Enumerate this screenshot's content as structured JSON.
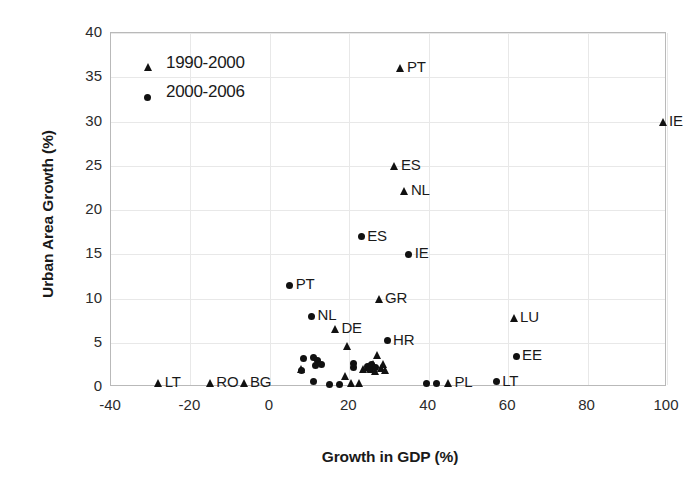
{
  "chart_data": {
    "type": "scatter",
    "title": "",
    "xlabel": "Growth in GDP (%)",
    "ylabel": "Urban Area Growth (%)",
    "xlim": [
      -40,
      100
    ],
    "ylim": [
      0,
      40
    ],
    "xticks": [
      -40,
      -20,
      0,
      20,
      40,
      60,
      80,
      100
    ],
    "yticks": [
      0,
      5,
      10,
      15,
      20,
      25,
      30,
      35,
      40
    ],
    "grid": true,
    "legend_position": "top-left",
    "series": [
      {
        "name": "1990-2000",
        "marker": "triangle",
        "color": "#111111",
        "points": [
          {
            "x": -28.0,
            "y": 0.4,
            "label": "LT"
          },
          {
            "x": -15.0,
            "y": 0.4,
            "label": "RO"
          },
          {
            "x": -6.5,
            "y": 0.5,
            "label": "BG"
          },
          {
            "x": 8.0,
            "y": 2.0,
            "label": ""
          },
          {
            "x": 16.5,
            "y": 6.5,
            "label": "DE"
          },
          {
            "x": 19.5,
            "y": 4.6,
            "label": ""
          },
          {
            "x": 19.0,
            "y": 1.2,
            "label": ""
          },
          {
            "x": 20.5,
            "y": 0.4,
            "label": ""
          },
          {
            "x": 22.5,
            "y": 0.4,
            "label": ""
          },
          {
            "x": 23.5,
            "y": 2.0,
            "label": ""
          },
          {
            "x": 24.5,
            "y": 2.3,
            "label": ""
          },
          {
            "x": 25.5,
            "y": 2.0,
            "label": ""
          },
          {
            "x": 26.0,
            "y": 2.6,
            "label": ""
          },
          {
            "x": 26.5,
            "y": 1.8,
            "label": ""
          },
          {
            "x": 27.5,
            "y": 10.0,
            "label": "GR"
          },
          {
            "x": 27.0,
            "y": 3.6,
            "label": ""
          },
          {
            "x": 28.0,
            "y": 2.2,
            "label": ""
          },
          {
            "x": 28.5,
            "y": 2.6,
            "label": ""
          },
          {
            "x": 29.0,
            "y": 1.9,
            "label": ""
          },
          {
            "x": 31.5,
            "y": 25.0,
            "label": "ES"
          },
          {
            "x": 34.0,
            "y": 22.2,
            "label": "NL"
          },
          {
            "x": 33.0,
            "y": 36.0,
            "label": "PT"
          },
          {
            "x": 45.0,
            "y": 0.5,
            "label": "PL"
          },
          {
            "x": 61.5,
            "y": 7.8,
            "label": "LU"
          },
          {
            "x": 99.0,
            "y": 30.0,
            "label": "IE"
          }
        ]
      },
      {
        "name": "2000-2006",
        "marker": "circle",
        "color": "#111111",
        "points": [
          {
            "x": 5.0,
            "y": 11.5,
            "label": "PT"
          },
          {
            "x": 10.5,
            "y": 8.0,
            "label": "NL"
          },
          {
            "x": 8.5,
            "y": 3.2,
            "label": ""
          },
          {
            "x": 8.0,
            "y": 1.9,
            "label": ""
          },
          {
            "x": 11.0,
            "y": 3.3,
            "label": ""
          },
          {
            "x": 12.0,
            "y": 3.0,
            "label": ""
          },
          {
            "x": 11.5,
            "y": 2.4,
            "label": ""
          },
          {
            "x": 11.0,
            "y": 0.6,
            "label": ""
          },
          {
            "x": 13.0,
            "y": 2.5,
            "label": ""
          },
          {
            "x": 15.0,
            "y": 0.3,
            "label": ""
          },
          {
            "x": 17.5,
            "y": 0.3,
            "label": ""
          },
          {
            "x": 21.0,
            "y": 2.7,
            "label": ""
          },
          {
            "x": 21.0,
            "y": 2.2,
            "label": ""
          },
          {
            "x": 23.0,
            "y": 17.0,
            "label": "ES"
          },
          {
            "x": 24.5,
            "y": 2.3,
            "label": ""
          },
          {
            "x": 25.0,
            "y": 2.0,
            "label": ""
          },
          {
            "x": 25.5,
            "y": 2.5,
            "label": ""
          },
          {
            "x": 26.5,
            "y": 2.2,
            "label": ""
          },
          {
            "x": 29.5,
            "y": 5.2,
            "label": "HR"
          },
          {
            "x": 35.0,
            "y": 15.0,
            "label": "IE"
          },
          {
            "x": 39.5,
            "y": 0.4,
            "label": ""
          },
          {
            "x": 42.0,
            "y": 0.4,
            "label": ""
          },
          {
            "x": 57.0,
            "y": 0.6,
            "label": "LT"
          },
          {
            "x": 62.0,
            "y": 3.5,
            "label": "EE"
          }
        ]
      }
    ]
  },
  "legend": {
    "items": [
      {
        "label": "1990-2000",
        "marker": "triangle"
      },
      {
        "label": "2000-2006",
        "marker": "circle"
      }
    ]
  }
}
